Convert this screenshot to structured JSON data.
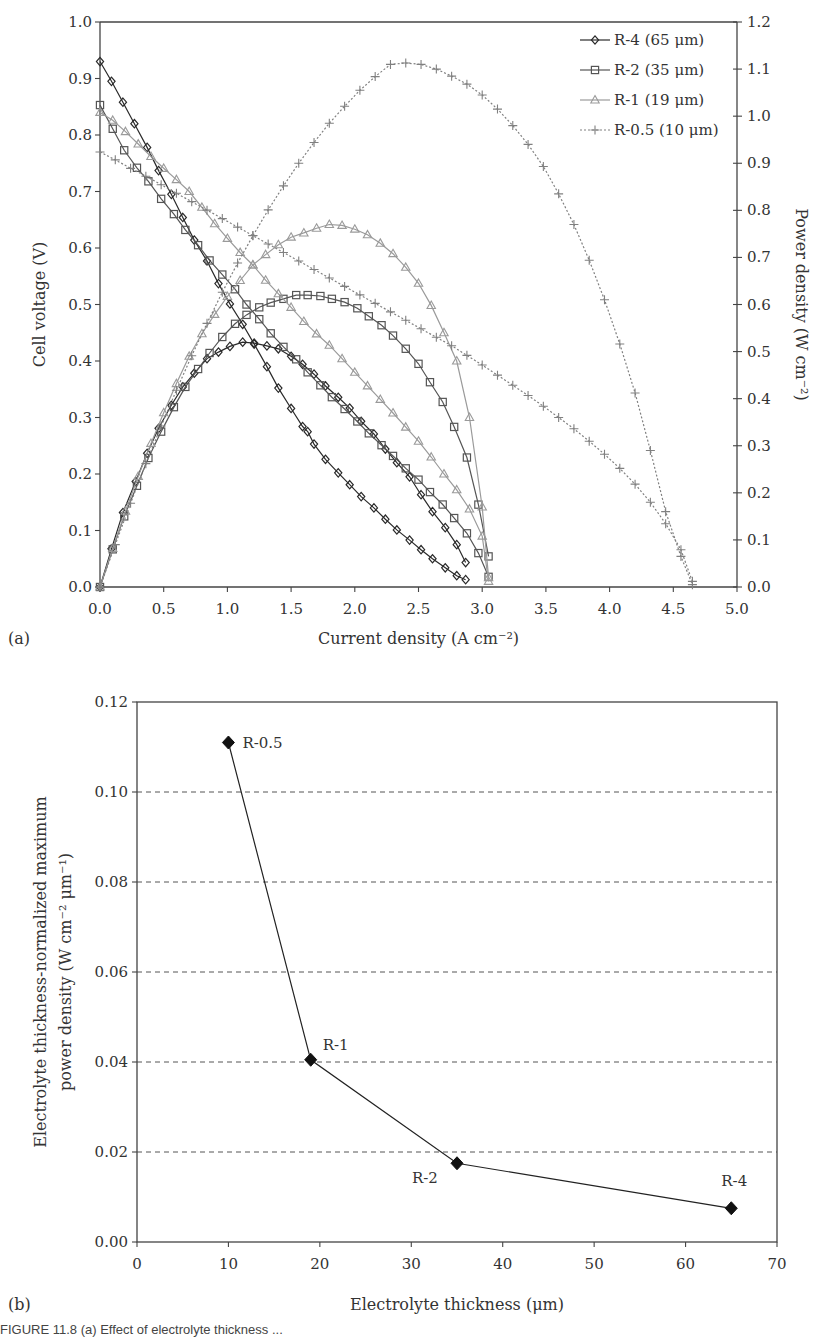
{
  "figure": {
    "panel_a_label": "(a)",
    "panel_b_label": "(b)",
    "caption_fragment": "FIGURE 11.8 (a) Effect of electrolyte thickness ..."
  },
  "chart_data": [
    {
      "panel": "a",
      "type": "line",
      "title": "",
      "xlabel": "Current density (A cm⁻²)",
      "ylabel": "Cell voltage (V)",
      "y2label": "Power density (W cm⁻²)",
      "xlim": [
        0.0,
        5.0
      ],
      "ylim": [
        0.0,
        1.0
      ],
      "y2lim": [
        0.0,
        1.2
      ],
      "x_ticks": [
        "0.0",
        "0.5",
        "1.0",
        "1.5",
        "2.0",
        "2.5",
        "3.0",
        "3.5",
        "4.0",
        "4.5",
        "5.0"
      ],
      "y_ticks": [
        "0.0",
        "0.1",
        "0.2",
        "0.3",
        "0.4",
        "0.5",
        "0.6",
        "0.7",
        "0.8",
        "0.9",
        "1.0"
      ],
      "y2_ticks": [
        "0.0",
        "0.1",
        "0.2",
        "0.3",
        "0.4",
        "0.5",
        "0.6",
        "0.7",
        "0.8",
        "0.9",
        "1.0",
        "1.1",
        "1.2"
      ],
      "grid": false,
      "legend_position": "top-right",
      "series": [
        {
          "name": "R-4 (65 μm)",
          "marker": "diamond",
          "color": "#2a2a2a",
          "dash": "",
          "voltage": {
            "x": [
              0.0,
              0.09,
              0.18,
              0.27,
              0.37,
              0.46,
              0.56,
              0.65,
              0.74,
              0.84,
              0.93,
              1.02,
              1.12,
              1.21,
              1.31,
              1.4,
              1.5,
              1.59,
              1.63,
              1.68,
              1.77,
              1.87,
              1.96,
              2.05,
              2.15,
              2.24,
              2.33,
              2.43,
              2.52,
              2.61,
              2.71,
              2.8,
              2.87
            ],
            "y": [
              0.93,
              0.895,
              0.858,
              0.82,
              0.778,
              0.737,
              0.695,
              0.654,
              0.614,
              0.577,
              0.537,
              0.501,
              0.465,
              0.43,
              0.39,
              0.352,
              0.316,
              0.284,
              0.275,
              0.253,
              0.226,
              0.202,
              0.181,
              0.16,
              0.14,
              0.12,
              0.101,
              0.083,
              0.066,
              0.05,
              0.034,
              0.02,
              0.013
            ]
          },
          "power": {
            "x": [
              0.0,
              0.09,
              0.18,
              0.28,
              0.37,
              0.46,
              0.56,
              0.65,
              0.74,
              0.84,
              0.93,
              1.02,
              1.12,
              1.21,
              1.31,
              1.4,
              1.5,
              1.59,
              1.68,
              1.77,
              1.87,
              1.96,
              2.05,
              2.15,
              2.24,
              2.33,
              2.43,
              2.52,
              2.61,
              2.71,
              2.8,
              2.87
            ],
            "y": [
              0.0,
              0.081,
              0.158,
              0.224,
              0.284,
              0.337,
              0.386,
              0.425,
              0.454,
              0.485,
              0.499,
              0.511,
              0.52,
              0.518,
              0.512,
              0.506,
              0.49,
              0.473,
              0.452,
              0.427,
              0.403,
              0.38,
              0.352,
              0.325,
              0.293,
              0.264,
              0.234,
              0.196,
              0.16,
              0.126,
              0.09,
              0.052
            ]
          }
        },
        {
          "name": "R-2 (35 μm)",
          "marker": "square",
          "color": "#555555",
          "dash": "",
          "voltage": {
            "x": [
              0.0,
              0.1,
              0.19,
              0.29,
              0.38,
              0.48,
              0.58,
              0.67,
              0.77,
              0.86,
              0.96,
              1.06,
              1.15,
              1.25,
              1.34,
              1.44,
              1.54,
              1.63,
              1.73,
              1.82,
              1.92,
              2.02,
              2.11,
              2.21,
              2.3,
              2.4,
              2.5,
              2.59,
              2.69,
              2.78,
              2.88,
              2.97,
              3.05
            ],
            "y": [
              0.853,
              0.811,
              0.773,
              0.742,
              0.718,
              0.687,
              0.66,
              0.632,
              0.605,
              0.578,
              0.553,
              0.527,
              0.5,
              0.474,
              0.449,
              0.425,
              0.403,
              0.38,
              0.357,
              0.336,
              0.315,
              0.293,
              0.272,
              0.251,
              0.232,
              0.21,
              0.19,
              0.168,
              0.146,
              0.122,
              0.095,
              0.06,
              0.018
            ]
          },
          "power": {
            "x": [
              0.0,
              0.1,
              0.19,
              0.29,
              0.38,
              0.48,
              0.58,
              0.67,
              0.77,
              0.86,
              0.96,
              1.06,
              1.15,
              1.25,
              1.34,
              1.44,
              1.54,
              1.63,
              1.73,
              1.82,
              1.92,
              2.02,
              2.11,
              2.21,
              2.3,
              2.4,
              2.5,
              2.59,
              2.69,
              2.78,
              2.88,
              2.97,
              3.05
            ],
            "y": [
              0.0,
              0.08,
              0.15,
              0.215,
              0.274,
              0.33,
              0.382,
              0.425,
              0.463,
              0.497,
              0.531,
              0.559,
              0.578,
              0.594,
              0.604,
              0.612,
              0.62,
              0.62,
              0.618,
              0.612,
              0.605,
              0.592,
              0.575,
              0.556,
              0.534,
              0.506,
              0.474,
              0.435,
              0.393,
              0.34,
              0.275,
              0.175,
              0.065
            ]
          }
        },
        {
          "name": "R-1 (19 μm)",
          "marker": "triangle",
          "color": "#9a9a9a",
          "dash": "",
          "voltage": {
            "x": [
              0.0,
              0.1,
              0.2,
              0.3,
              0.4,
              0.5,
              0.6,
              0.7,
              0.8,
              0.9,
              1.0,
              1.1,
              1.2,
              1.3,
              1.4,
              1.5,
              1.6,
              1.7,
              1.8,
              1.9,
              2.0,
              2.1,
              2.2,
              2.3,
              2.4,
              2.5,
              2.6,
              2.7,
              2.8,
              2.9,
              3.0,
              3.05
            ],
            "y": [
              0.84,
              0.826,
              0.806,
              0.784,
              0.762,
              0.741,
              0.721,
              0.7,
              0.672,
              0.643,
              0.617,
              0.592,
              0.57,
              0.543,
              0.519,
              0.495,
              0.47,
              0.448,
              0.428,
              0.404,
              0.38,
              0.356,
              0.332,
              0.308,
              0.283,
              0.258,
              0.23,
              0.2,
              0.172,
              0.138,
              0.09,
              0.01
            ]
          },
          "power": {
            "x": [
              0.0,
              0.1,
              0.2,
              0.3,
              0.4,
              0.5,
              0.6,
              0.7,
              0.8,
              0.9,
              1.0,
              1.1,
              1.2,
              1.3,
              1.4,
              1.5,
              1.6,
              1.7,
              1.8,
              1.9,
              2.0,
              2.1,
              2.2,
              2.3,
              2.4,
              2.5,
              2.6,
              2.7,
              2.8,
              2.9,
              3.0,
              3.05
            ],
            "y": [
              0.0,
              0.082,
              0.161,
              0.235,
              0.305,
              0.37,
              0.432,
              0.49,
              0.538,
              0.579,
              0.617,
              0.651,
              0.684,
              0.706,
              0.727,
              0.743,
              0.752,
              0.762,
              0.77,
              0.768,
              0.76,
              0.748,
              0.73,
              0.708,
              0.679,
              0.645,
              0.598,
              0.54,
              0.48,
              0.36,
              0.17,
              0.02
            ]
          }
        },
        {
          "name": "R-0.5 (10 μm)",
          "marker": "plus",
          "color": "#808080",
          "dash": "2,2",
          "voltage": {
            "x": [
              0.0,
              0.12,
              0.24,
              0.36,
              0.48,
              0.6,
              0.72,
              0.84,
              0.96,
              1.08,
              1.2,
              1.32,
              1.44,
              1.56,
              1.68,
              1.8,
              1.92,
              2.04,
              2.16,
              2.28,
              2.4,
              2.52,
              2.64,
              2.76,
              2.88,
              3.0,
              3.12,
              3.24,
              3.36,
              3.48,
              3.6,
              3.72,
              3.84,
              3.96,
              4.08,
              4.2,
              4.32,
              4.44,
              4.56,
              4.65
            ],
            "y": [
              0.77,
              0.756,
              0.741,
              0.727,
              0.712,
              0.697,
              0.682,
              0.667,
              0.652,
              0.637,
              0.622,
              0.607,
              0.592,
              0.577,
              0.562,
              0.547,
              0.532,
              0.517,
              0.502,
              0.487,
              0.472,
              0.457,
              0.442,
              0.427,
              0.41,
              0.393,
              0.375,
              0.357,
              0.339,
              0.32,
              0.3,
              0.28,
              0.258,
              0.235,
              0.21,
              0.182,
              0.15,
              0.112,
              0.066,
              0.01
            ]
          },
          "power": {
            "x": [
              0.0,
              0.12,
              0.24,
              0.36,
              0.48,
              0.6,
              0.72,
              0.84,
              0.96,
              1.08,
              1.2,
              1.32,
              1.44,
              1.56,
              1.68,
              1.8,
              1.92,
              2.04,
              2.16,
              2.28,
              2.4,
              2.52,
              2.64,
              2.76,
              2.88,
              3.0,
              3.12,
              3.24,
              3.36,
              3.48,
              3.6,
              3.72,
              3.84,
              3.96,
              4.08,
              4.2,
              4.32,
              4.44,
              4.56,
              4.65
            ],
            "y": [
              0.0,
              0.09,
              0.178,
              0.262,
              0.342,
              0.418,
              0.491,
              0.56,
              0.626,
              0.688,
              0.746,
              0.801,
              0.852,
              0.9,
              0.944,
              0.985,
              1.021,
              1.055,
              1.084,
              1.11,
              1.113,
              1.11,
              1.1,
              1.085,
              1.068,
              1.045,
              1.015,
              0.98,
              0.94,
              0.893,
              0.835,
              0.77,
              0.694,
              0.61,
              0.516,
              0.412,
              0.29,
              0.16,
              0.065,
              0.005
            ]
          }
        }
      ]
    },
    {
      "panel": "b",
      "type": "line",
      "title": "",
      "xlabel": "Electrolyte thickness (μm)",
      "ylabel": "Electrolyte thickness-normalized maximum power density (W cm⁻² μm⁻¹)",
      "ylabel_line1": "Electrolyte thickness-normalized maximum",
      "ylabel_line2": "power density (W cm⁻² μm⁻¹)",
      "xlim": [
        0,
        70
      ],
      "ylim": [
        0.0,
        0.12
      ],
      "x_ticks": [
        "0",
        "10",
        "20",
        "30",
        "40",
        "50",
        "60",
        "70"
      ],
      "y_ticks": [
        "0.00",
        "0.02",
        "0.04",
        "0.06",
        "0.08",
        "0.10",
        "0.12"
      ],
      "grid": "horizontal-dashed",
      "marker": "filled-diamond",
      "x": [
        10,
        19,
        35,
        65
      ],
      "values": [
        0.111,
        0.0405,
        0.0175,
        0.0075
      ],
      "point_labels": [
        "R-0.5",
        "R-1",
        "R-2",
        "R-4"
      ]
    }
  ]
}
